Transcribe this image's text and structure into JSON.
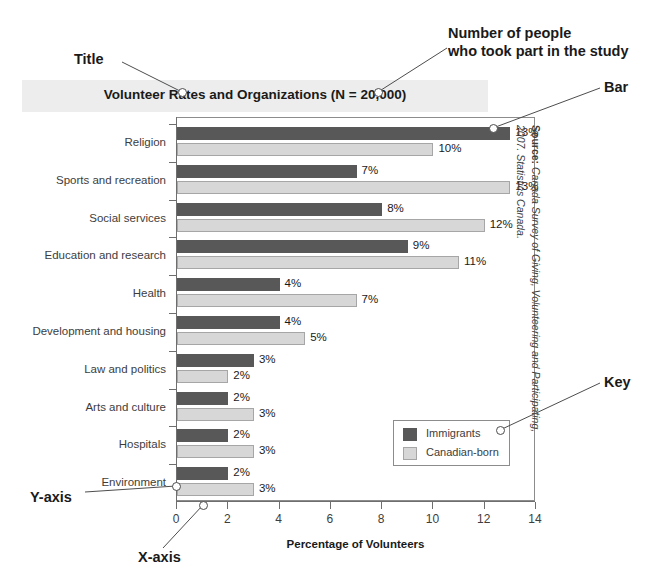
{
  "chart_data": {
    "type": "bar",
    "orientation": "horizontal",
    "title": "Volunteer Rates and Organizations (N = 20,000)",
    "xlabel": "Percentage of Volunteers",
    "ylabel": "",
    "xlim": [
      0,
      14
    ],
    "xticks": [
      0,
      2,
      4,
      6,
      8,
      10,
      12,
      14
    ],
    "grid": false,
    "legend_position": "inside-bottom-right",
    "categories": [
      "Religion",
      "Sports and recreation",
      "Social services",
      "Education and research",
      "Health",
      "Development and housing",
      "Law and politics",
      "Arts and culture",
      "Hospitals",
      "Environment"
    ],
    "series": [
      {
        "name": "Immigrants",
        "color": "#585858",
        "values": [
          13,
          7,
          8,
          9,
          4,
          4,
          3,
          2,
          2,
          2
        ],
        "labels": [
          "13%",
          "7%",
          "8%",
          "9%",
          "4%",
          "4%",
          "3%",
          "2%",
          "2%",
          "2%"
        ]
      },
      {
        "name": "Canadian-born",
        "color": "#d7d7d7",
        "values": [
          10,
          13,
          12,
          11,
          7,
          5,
          2,
          3,
          3,
          3
        ],
        "labels": [
          "10%",
          "13%",
          "12%",
          "11%",
          "7%",
          "5%",
          "2%",
          "3%",
          "3%",
          "3%"
        ]
      }
    ],
    "source": "Canada Survey of Giving, Volunteering and Participating, 2007. Statistics Canada.",
    "source_prefix": "Source:"
  },
  "annotations": [
    {
      "id": "title",
      "text": "Title"
    },
    {
      "id": "n-value",
      "text": "Number of people\nwho took part in the study",
      "line1": "Number of people",
      "line2": "who took part in the study"
    },
    {
      "id": "bar",
      "text": "Bar"
    },
    {
      "id": "key",
      "text": "Key"
    },
    {
      "id": "y-axis",
      "text": "Y-axis"
    },
    {
      "id": "x-axis",
      "text": "X-axis"
    }
  ],
  "colors": {
    "immigrants": "#585858",
    "canadian_born": "#d7d7d7",
    "title_band": "#ededed",
    "axis": "#6e6e6e",
    "text": "#1a1a1a"
  }
}
